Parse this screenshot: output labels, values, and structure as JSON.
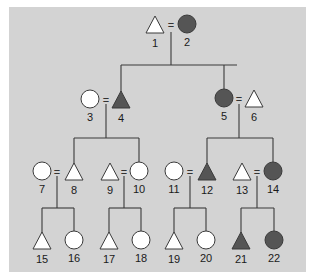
{
  "diagram": {
    "type": "pedigree",
    "colors": {
      "background": "#d3d3d3",
      "affected": "#555555",
      "unaffected": "#ffffff",
      "line": "#3a3a3a"
    },
    "legend_note": "triangle = male, circle = female, filled = affected",
    "individuals": [
      {
        "id": 1,
        "label": "1",
        "shape": "triangle",
        "affected": false,
        "x": 155,
        "y": 25
      },
      {
        "id": 2,
        "label": "2",
        "shape": "circle",
        "affected": true,
        "x": 187,
        "y": 24
      },
      {
        "id": 3,
        "label": "3",
        "shape": "circle",
        "affected": false,
        "x": 90,
        "y": 99
      },
      {
        "id": 4,
        "label": "4",
        "shape": "triangle",
        "affected": true,
        "x": 121,
        "y": 100
      },
      {
        "id": 5,
        "label": "5",
        "shape": "circle",
        "affected": true,
        "x": 224,
        "y": 98
      },
      {
        "id": 6,
        "label": "6",
        "shape": "triangle",
        "affected": false,
        "x": 254,
        "y": 99
      },
      {
        "id": 7,
        "label": "7",
        "shape": "circle",
        "affected": false,
        "x": 42,
        "y": 171
      },
      {
        "id": 8,
        "label": "8",
        "shape": "triangle",
        "affected": false,
        "x": 74,
        "y": 172
      },
      {
        "id": 9,
        "label": "9",
        "shape": "triangle",
        "affected": false,
        "x": 110,
        "y": 172
      },
      {
        "id": 10,
        "label": "10",
        "shape": "circle",
        "affected": false,
        "x": 139,
        "y": 171
      },
      {
        "id": 11,
        "label": "11",
        "shape": "circle",
        "affected": false,
        "x": 174,
        "y": 171
      },
      {
        "id": 12,
        "label": "12",
        "shape": "triangle",
        "affected": true,
        "x": 207,
        "y": 172
      },
      {
        "id": 13,
        "label": "13",
        "shape": "triangle",
        "affected": false,
        "x": 242,
        "y": 172
      },
      {
        "id": 14,
        "label": "14",
        "shape": "circle",
        "affected": true,
        "x": 273,
        "y": 171
      },
      {
        "id": 15,
        "label": "15",
        "shape": "triangle",
        "affected": false,
        "x": 42,
        "y": 241
      },
      {
        "id": 16,
        "label": "16",
        "shape": "circle",
        "affected": false,
        "x": 74,
        "y": 240
      },
      {
        "id": 17,
        "label": "17",
        "shape": "triangle",
        "affected": false,
        "x": 109,
        "y": 241
      },
      {
        "id": 18,
        "label": "18",
        "shape": "circle",
        "affected": false,
        "x": 141,
        "y": 240
      },
      {
        "id": 19,
        "label": "19",
        "shape": "triangle",
        "affected": false,
        "x": 174,
        "y": 241
      },
      {
        "id": 20,
        "label": "20",
        "shape": "circle",
        "affected": false,
        "x": 206,
        "y": 240
      },
      {
        "id": 21,
        "label": "21",
        "shape": "triangle",
        "affected": true,
        "x": 241,
        "y": 241
      },
      {
        "id": 22,
        "label": "22",
        "shape": "circle",
        "affected": true,
        "x": 274,
        "y": 240
      }
    ],
    "marriages": [
      {
        "partners": [
          1,
          2
        ],
        "symbol": "=",
        "x": 171,
        "y": 25
      },
      {
        "partners": [
          3,
          4
        ],
        "symbol": "=",
        "x": 106,
        "y": 100
      },
      {
        "partners": [
          5,
          6
        ],
        "symbol": "=",
        "x": 239,
        "y": 99
      },
      {
        "partners": [
          7,
          8
        ],
        "symbol": "=",
        "x": 57,
        "y": 172
      },
      {
        "partners": [
          9,
          10
        ],
        "symbol": "=",
        "x": 124,
        "y": 172
      },
      {
        "partners": [
          11,
          12
        ],
        "symbol": "=",
        "x": 190,
        "y": 172
      },
      {
        "partners": [
          13,
          14
        ],
        "symbol": "=",
        "x": 257,
        "y": 172
      }
    ],
    "lines": [
      [
        171,
        32,
        171,
        65
      ],
      [
        121,
        65,
        237,
        65
      ],
      [
        121,
        65,
        121,
        92
      ],
      [
        224,
        65,
        224,
        89
      ],
      [
        106,
        104,
        106,
        138
      ],
      [
        74,
        138,
        139,
        138
      ],
      [
        74,
        138,
        74,
        164
      ],
      [
        139,
        138,
        139,
        162
      ],
      [
        239,
        104,
        239,
        138
      ],
      [
        207,
        138,
        273,
        138
      ],
      [
        207,
        138,
        207,
        164
      ],
      [
        273,
        138,
        273,
        162
      ],
      [
        57,
        176,
        57,
        208
      ],
      [
        42,
        208,
        74,
        208
      ],
      [
        42,
        208,
        42,
        233
      ],
      [
        74,
        208,
        74,
        231
      ],
      [
        124,
        176,
        124,
        208
      ],
      [
        109,
        208,
        141,
        208
      ],
      [
        109,
        208,
        109,
        233
      ],
      [
        141,
        208,
        141,
        231
      ],
      [
        190,
        176,
        190,
        208
      ],
      [
        174,
        208,
        206,
        208
      ],
      [
        174,
        208,
        174,
        233
      ],
      [
        206,
        208,
        206,
        231
      ],
      [
        257,
        176,
        257,
        208
      ],
      [
        241,
        208,
        274,
        208
      ],
      [
        241,
        208,
        241,
        233
      ],
      [
        274,
        208,
        274,
        231
      ]
    ]
  }
}
